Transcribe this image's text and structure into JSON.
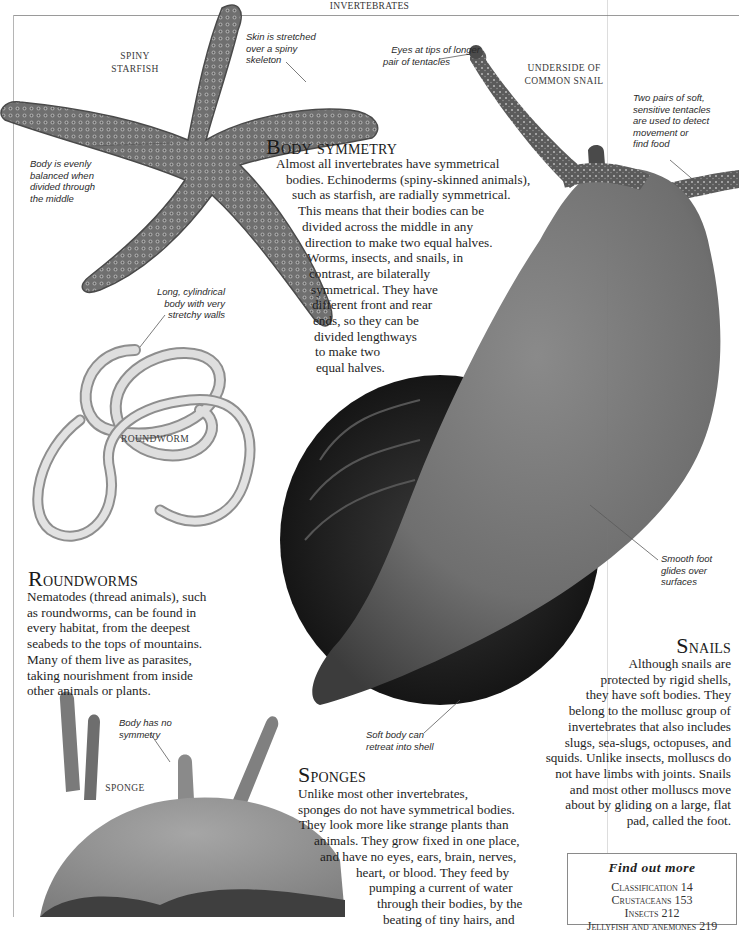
{
  "running_head": "INVERTEBRATES",
  "labels": {
    "starfish": [
      "SPINY",
      "STARFISH"
    ],
    "snail": [
      "UNDERSIDE OF",
      "COMMON  SNAIL"
    ],
    "roundworm": "ROUNDWORM",
    "sponge": "SPONGE"
  },
  "annotations": {
    "skin_stretched": [
      "Skin is stretched",
      "over a spiny",
      "skeleton"
    ],
    "body_balanced": [
      "Body is evenly",
      "balanced when",
      "divided through",
      "the middle"
    ],
    "eyes_tips": [
      "Eyes at tips of longer",
      "pair of tentacles"
    ],
    "tentacles": [
      "Two pairs of soft,",
      "sensitive tentacles",
      "are used to detect",
      "movement or",
      "find food"
    ],
    "cylindrical_body": [
      "Long, cylindrical",
      "body with very",
      "stretchy walls"
    ],
    "smooth_foot": [
      "Smooth foot",
      "glides over",
      "surfaces"
    ],
    "soft_body_retreat": [
      "Soft body can",
      "retreat into shell"
    ],
    "no_symmetry": [
      "Body has no",
      "symmetry"
    ]
  },
  "sections": {
    "body_symmetry": {
      "heading_initial": "B",
      "heading_rest": "ody symmetry",
      "lines": [
        "Almost all invertebrates have symmetrical",
        "bodies. Echinoderms (spiny-skinned animals),",
        "such as starfish, are radially symmetrical.",
        "This means that their bodies can be",
        "divided across the middle in any",
        "direction to make two equal halves.",
        "Worms, insects, and snails, in",
        "contrast, are bilaterally",
        "symmetrical. They have",
        "different front and rear",
        "ends, so they can be",
        "divided lengthways",
        "to make two",
        "equal halves."
      ]
    },
    "roundworms": {
      "heading_initial": "R",
      "heading_rest": "oundworms",
      "lines": [
        "Nematodes (thread animals), such",
        "as roundworms, can be found in",
        "every habitat, from the deepest",
        "seabeds to the tops of mountains.",
        "Many of them live as parasites,",
        "taking nourishment from inside",
        "other animals or plants."
      ]
    },
    "snails": {
      "heading_initial": "S",
      "heading_rest": "nails",
      "lines": [
        "Although snails are",
        "protected by rigid shells,",
        "they have soft bodies. They",
        "belong to the mollusc group of",
        "invertebrates that also includes",
        "slugs, sea-slugs, octopuses, and",
        "squids. Unlike insects, molluscs do",
        "not have limbs with joints. Snails",
        "and most other molluscs move",
        "about by gliding on a large, flat",
        "pad, called the foot."
      ]
    },
    "sponges": {
      "heading_initial": "S",
      "heading_rest": "ponges",
      "lines": [
        "Unlike most other invertebrates,",
        "sponges do not have symmetrical bodies.",
        "They look more like strange plants than",
        "animals. They grow fixed in one place,",
        "and have no eyes, ears, brain, nerves,",
        "heart, or blood. They feed by",
        "pumping a current of water",
        "through their bodies, by the",
        "beating of tiny hairs, and"
      ]
    }
  },
  "find_out_more": {
    "title": "Find out more",
    "items": [
      {
        "label": "Classification",
        "page": "14"
      },
      {
        "label": "Crustaceans",
        "page": "153"
      },
      {
        "label": "Insects",
        "page": "212"
      },
      {
        "label": "Jellyfish and anemones",
        "page": "219"
      }
    ]
  }
}
